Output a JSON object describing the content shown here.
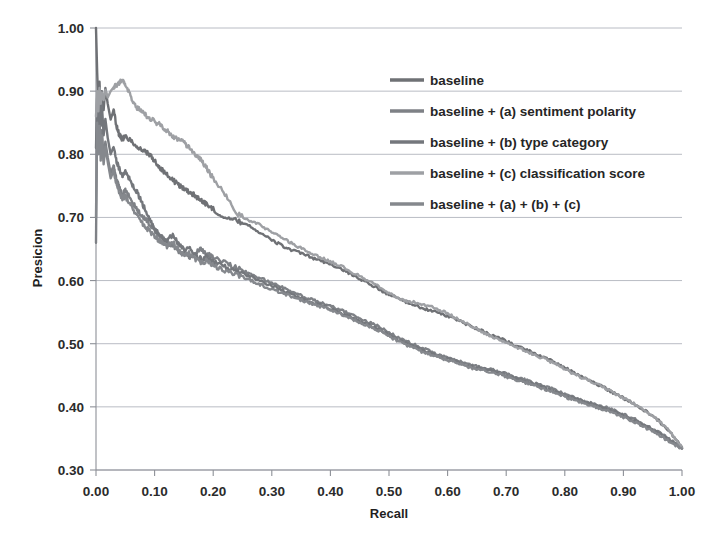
{
  "chart_data": {
    "type": "line",
    "title": "",
    "xlabel": "Recall",
    "ylabel": "Presicion",
    "xlim": [
      0.0,
      1.0
    ],
    "ylim": [
      0.3,
      1.0
    ],
    "grid": true,
    "legend_position": "upper-right",
    "xticks": [
      "0.00",
      "0.10",
      "0.20",
      "0.30",
      "0.40",
      "0.50",
      "0.60",
      "0.70",
      "0.80",
      "0.90",
      "1.00"
    ],
    "yticks": [
      "0.30",
      "0.40",
      "0.50",
      "0.60",
      "0.70",
      "0.80",
      "0.90",
      "1.00"
    ],
    "xtick_values": [
      0.0,
      0.1,
      0.2,
      0.3,
      0.4,
      0.5,
      0.6,
      0.7,
      0.8,
      0.9,
      1.0
    ],
    "ytick_values": [
      0.3,
      0.4,
      0.5,
      0.6,
      0.7,
      0.8,
      0.9,
      1.0
    ],
    "series": [
      {
        "name": "baseline",
        "color": "#6f7175",
        "width": 2.4,
        "x": [
          0.0,
          0.002,
          0.004,
          0.006,
          0.008,
          0.01,
          0.013,
          0.016,
          0.02,
          0.025,
          0.03,
          0.035,
          0.04,
          0.045,
          0.05,
          0.06,
          0.07,
          0.08,
          0.09,
          0.1,
          0.11,
          0.12,
          0.13,
          0.14,
          0.15,
          0.16,
          0.17,
          0.18,
          0.19,
          0.2,
          0.22,
          0.24,
          0.26,
          0.28,
          0.3,
          0.32,
          0.34,
          0.36,
          0.38,
          0.4,
          0.42,
          0.44,
          0.46,
          0.48,
          0.5,
          0.52,
          0.54,
          0.56,
          0.58,
          0.6,
          0.62,
          0.64,
          0.66,
          0.68,
          0.7,
          0.72,
          0.74,
          0.76,
          0.78,
          0.8,
          0.82,
          0.84,
          0.86,
          0.88,
          0.9,
          0.92,
          0.94,
          0.96,
          0.98,
          1.0
        ],
        "y": [
          1.0,
          0.93,
          0.88,
          0.915,
          0.86,
          0.9,
          0.87,
          0.905,
          0.88,
          0.855,
          0.87,
          0.845,
          0.83,
          0.824,
          0.828,
          0.822,
          0.812,
          0.806,
          0.8,
          0.79,
          0.778,
          0.768,
          0.76,
          0.752,
          0.746,
          0.74,
          0.734,
          0.727,
          0.72,
          0.713,
          0.7,
          0.695,
          0.688,
          0.676,
          0.664,
          0.654,
          0.646,
          0.64,
          0.632,
          0.626,
          0.618,
          0.608,
          0.598,
          0.588,
          0.578,
          0.57,
          0.562,
          0.556,
          0.55,
          0.544,
          0.536,
          0.528,
          0.52,
          0.512,
          0.504,
          0.496,
          0.488,
          0.48,
          0.472,
          0.462,
          0.452,
          0.443,
          0.434,
          0.424,
          0.414,
          0.404,
          0.392,
          0.378,
          0.36,
          0.336
        ]
      },
      {
        "name": "baseline + (a) sentiment polarity",
        "color": "#7e8186",
        "width": 2.4,
        "x": [
          0.0,
          0.002,
          0.004,
          0.006,
          0.008,
          0.01,
          0.013,
          0.016,
          0.02,
          0.025,
          0.03,
          0.035,
          0.04,
          0.045,
          0.05,
          0.06,
          0.07,
          0.08,
          0.09,
          0.1,
          0.11,
          0.12,
          0.13,
          0.14,
          0.15,
          0.16,
          0.17,
          0.18,
          0.19,
          0.2,
          0.22,
          0.24,
          0.26,
          0.28,
          0.3,
          0.32,
          0.34,
          0.36,
          0.38,
          0.4,
          0.42,
          0.44,
          0.46,
          0.48,
          0.5,
          0.52,
          0.54,
          0.56,
          0.58,
          0.6,
          0.62,
          0.64,
          0.66,
          0.68,
          0.7,
          0.72,
          0.74,
          0.76,
          0.78,
          0.8,
          0.82,
          0.84,
          0.86,
          0.88,
          0.9,
          0.92,
          0.94,
          0.96,
          0.98,
          1.0
        ],
        "y": [
          0.66,
          0.87,
          0.82,
          0.86,
          0.8,
          0.838,
          0.79,
          0.82,
          0.795,
          0.77,
          0.782,
          0.76,
          0.748,
          0.736,
          0.742,
          0.728,
          0.712,
          0.7,
          0.692,
          0.68,
          0.67,
          0.662,
          0.656,
          0.648,
          0.64,
          0.636,
          0.644,
          0.65,
          0.642,
          0.636,
          0.628,
          0.62,
          0.612,
          0.604,
          0.596,
          0.588,
          0.58,
          0.572,
          0.566,
          0.56,
          0.552,
          0.544,
          0.536,
          0.528,
          0.518,
          0.508,
          0.5,
          0.492,
          0.484,
          0.478,
          0.472,
          0.466,
          0.462,
          0.458,
          0.452,
          0.446,
          0.44,
          0.434,
          0.428,
          0.42,
          0.414,
          0.408,
          0.402,
          0.396,
          0.388,
          0.38,
          0.37,
          0.36,
          0.348,
          0.334
        ]
      },
      {
        "name": "baseline + (b) type category",
        "color": "#74777c",
        "width": 2.4,
        "x": [
          0.0,
          0.002,
          0.004,
          0.006,
          0.008,
          0.01,
          0.013,
          0.016,
          0.02,
          0.025,
          0.03,
          0.035,
          0.04,
          0.045,
          0.05,
          0.06,
          0.07,
          0.08,
          0.09,
          0.1,
          0.11,
          0.12,
          0.13,
          0.14,
          0.15,
          0.16,
          0.17,
          0.18,
          0.19,
          0.2,
          0.22,
          0.24,
          0.26,
          0.28,
          0.3,
          0.32,
          0.34,
          0.36,
          0.38,
          0.4,
          0.42,
          0.44,
          0.46,
          0.48,
          0.5,
          0.52,
          0.54,
          0.56,
          0.58,
          0.6,
          0.62,
          0.64,
          0.66,
          0.68,
          0.7,
          0.72,
          0.74,
          0.76,
          0.78,
          0.8,
          0.82,
          0.84,
          0.86,
          0.88,
          0.9,
          0.92,
          0.94,
          0.96,
          0.98,
          1.0
        ],
        "y": [
          0.81,
          0.89,
          0.84,
          0.905,
          0.845,
          0.88,
          0.83,
          0.856,
          0.826,
          0.8,
          0.812,
          0.79,
          0.776,
          0.766,
          0.772,
          0.756,
          0.74,
          0.72,
          0.7,
          0.682,
          0.67,
          0.662,
          0.672,
          0.66,
          0.648,
          0.652,
          0.64,
          0.634,
          0.638,
          0.63,
          0.622,
          0.614,
          0.608,
          0.6,
          0.592,
          0.584,
          0.576,
          0.568,
          0.562,
          0.556,
          0.548,
          0.54,
          0.532,
          0.524,
          0.514,
          0.504,
          0.496,
          0.488,
          0.482,
          0.476,
          0.47,
          0.464,
          0.46,
          0.456,
          0.45,
          0.444,
          0.438,
          0.432,
          0.426,
          0.418,
          0.412,
          0.406,
          0.4,
          0.394,
          0.386,
          0.378,
          0.368,
          0.358,
          0.346,
          0.334
        ]
      },
      {
        "name": "baseline + (c) classification score",
        "color": "#9ea0a4",
        "width": 2.4,
        "x": [
          0.0,
          0.002,
          0.004,
          0.006,
          0.008,
          0.01,
          0.013,
          0.016,
          0.02,
          0.025,
          0.03,
          0.035,
          0.04,
          0.045,
          0.05,
          0.06,
          0.07,
          0.08,
          0.09,
          0.1,
          0.11,
          0.12,
          0.13,
          0.14,
          0.15,
          0.16,
          0.17,
          0.18,
          0.19,
          0.2,
          0.22,
          0.24,
          0.26,
          0.28,
          0.3,
          0.32,
          0.34,
          0.36,
          0.38,
          0.4,
          0.42,
          0.44,
          0.46,
          0.48,
          0.5,
          0.52,
          0.54,
          0.56,
          0.58,
          0.6,
          0.62,
          0.64,
          0.66,
          0.68,
          0.7,
          0.72,
          0.74,
          0.76,
          0.78,
          0.8,
          0.82,
          0.84,
          0.86,
          0.88,
          0.9,
          0.92,
          0.94,
          0.96,
          0.98,
          1.0
        ],
        "y": [
          0.86,
          0.9,
          0.868,
          0.905,
          0.88,
          0.898,
          0.886,
          0.902,
          0.89,
          0.9,
          0.906,
          0.91,
          0.914,
          0.916,
          0.91,
          0.89,
          0.874,
          0.866,
          0.858,
          0.852,
          0.846,
          0.838,
          0.83,
          0.824,
          0.818,
          0.81,
          0.8,
          0.79,
          0.776,
          0.762,
          0.736,
          0.706,
          0.696,
          0.688,
          0.676,
          0.666,
          0.656,
          0.646,
          0.638,
          0.63,
          0.622,
          0.612,
          0.602,
          0.592,
          0.58,
          0.57,
          0.566,
          0.562,
          0.556,
          0.548,
          0.538,
          0.528,
          0.518,
          0.51,
          0.502,
          0.494,
          0.486,
          0.478,
          0.47,
          0.46,
          0.45,
          0.442,
          0.434,
          0.424,
          0.414,
          0.404,
          0.392,
          0.378,
          0.36,
          0.335
        ]
      },
      {
        "name": "baseline + (a) + (b) + (c)",
        "color": "#85888d",
        "width": 2.4,
        "x": [
          0.0,
          0.002,
          0.004,
          0.006,
          0.008,
          0.01,
          0.013,
          0.016,
          0.02,
          0.025,
          0.03,
          0.035,
          0.04,
          0.045,
          0.05,
          0.06,
          0.07,
          0.08,
          0.09,
          0.1,
          0.11,
          0.12,
          0.13,
          0.14,
          0.15,
          0.16,
          0.17,
          0.18,
          0.19,
          0.2,
          0.22,
          0.24,
          0.26,
          0.28,
          0.3,
          0.32,
          0.34,
          0.36,
          0.38,
          0.4,
          0.42,
          0.44,
          0.46,
          0.48,
          0.5,
          0.52,
          0.54,
          0.56,
          0.58,
          0.6,
          0.62,
          0.64,
          0.66,
          0.68,
          0.7,
          0.72,
          0.74,
          0.76,
          0.78,
          0.8,
          0.82,
          0.84,
          0.86,
          0.88,
          0.9,
          0.92,
          0.94,
          0.96,
          0.98,
          1.0
        ],
        "y": [
          0.7,
          0.85,
          0.8,
          0.845,
          0.79,
          0.83,
          0.784,
          0.812,
          0.788,
          0.762,
          0.774,
          0.752,
          0.74,
          0.73,
          0.734,
          0.718,
          0.702,
          0.69,
          0.68,
          0.67,
          0.662,
          0.654,
          0.662,
          0.65,
          0.64,
          0.644,
          0.634,
          0.628,
          0.632,
          0.624,
          0.616,
          0.61,
          0.602,
          0.594,
          0.586,
          0.58,
          0.572,
          0.566,
          0.56,
          0.554,
          0.546,
          0.538,
          0.53,
          0.522,
          0.512,
          0.502,
          0.494,
          0.486,
          0.48,
          0.474,
          0.468,
          0.462,
          0.458,
          0.454,
          0.448,
          0.442,
          0.436,
          0.43,
          0.424,
          0.416,
          0.41,
          0.404,
          0.398,
          0.392,
          0.384,
          0.376,
          0.366,
          0.356,
          0.344,
          0.334
        ]
      }
    ]
  },
  "legend": {
    "entries": [
      {
        "label": "baseline"
      },
      {
        "label": "baseline + (a) sentiment polarity"
      },
      {
        "label": "baseline + (b) type category"
      },
      {
        "label": "baseline + (c) classification score"
      },
      {
        "label": "baseline + (a) + (b) + (c)"
      }
    ]
  }
}
